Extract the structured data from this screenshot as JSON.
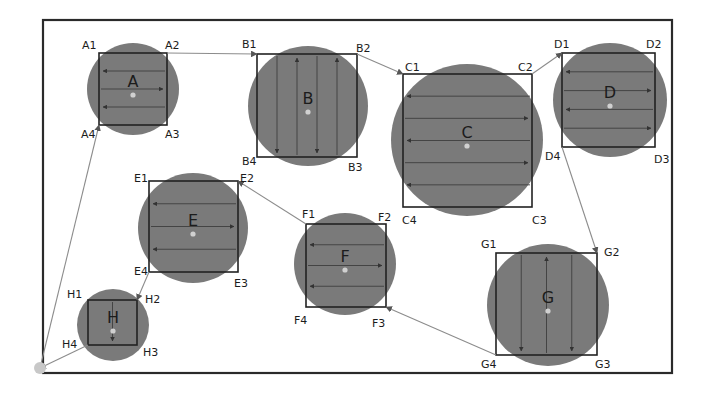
{
  "diagram": {
    "frame": {
      "x": 43,
      "y": 20,
      "w": 629,
      "h": 353
    },
    "colors": {
      "disk": "#7a7a7a",
      "square": "#222222",
      "link": "#8c8c8c",
      "frame": "#2a2a2a",
      "background": "#ffffff"
    },
    "start_point": {
      "x": 40,
      "y": 368
    },
    "areas": [
      {
        "id": "A",
        "label": "A",
        "cx": 133,
        "cy": 89,
        "r": 46,
        "sq": [
          99,
          53,
          167,
          125
        ],
        "scan": "horizontal",
        "lines": 3,
        "corners": [
          "A1",
          "A2",
          "A3",
          "A4"
        ]
      },
      {
        "id": "B",
        "label": "B",
        "cx": 308,
        "cy": 106,
        "r": 60,
        "sq": [
          257,
          54,
          357,
          157
        ],
        "scan": "vertical",
        "lines": 4,
        "corners": [
          "B1",
          "B2",
          "B3",
          "B4"
        ]
      },
      {
        "id": "C",
        "label": "C",
        "cx": 467,
        "cy": 140,
        "r": 76,
        "sq": [
          403,
          74,
          532,
          207
        ],
        "scan": "horizontal",
        "lines": 5,
        "corners": [
          "C1",
          "C2",
          "C3",
          "C4"
        ]
      },
      {
        "id": "D",
        "label": "D",
        "cx": 610,
        "cy": 100,
        "r": 57,
        "sq": [
          562,
          53,
          655,
          147
        ],
        "scan": "horizontal",
        "lines": 4,
        "corners": [
          "D1",
          "D2",
          "D3",
          "D4"
        ]
      },
      {
        "id": "E",
        "label": "E",
        "cx": 193,
        "cy": 228,
        "r": 55,
        "sq": [
          149,
          181,
          238,
          272
        ],
        "scan": "horizontal",
        "lines": 3,
        "corners": [
          "E1",
          "E2",
          "E3",
          "E4"
        ]
      },
      {
        "id": "F",
        "label": "F",
        "cx": 345,
        "cy": 264,
        "r": 51,
        "sq": [
          306,
          224,
          386,
          307
        ],
        "scan": "horizontal",
        "lines": 3,
        "corners": [
          "F1",
          "F2",
          "F3",
          "F4"
        ]
      },
      {
        "id": "G",
        "label": "G",
        "cx": 548,
        "cy": 305,
        "r": 61,
        "sq": [
          496,
          253,
          597,
          355
        ],
        "scan": "vertical",
        "lines": 3,
        "corners": [
          "G1",
          "G2",
          "G3",
          "G4"
        ]
      },
      {
        "id": "H",
        "label": "H",
        "cx": 113,
        "cy": 325,
        "r": 36,
        "sq": [
          88,
          300,
          137,
          345
        ],
        "scan": "vertical",
        "lines": 1,
        "corners": [
          "H1",
          "H2",
          "H3",
          "H4"
        ]
      }
    ],
    "corner_labels": {
      "A1": {
        "x": 82,
        "y": 49
      },
      "A2": {
        "x": 165,
        "y": 49
      },
      "A3": {
        "x": 165,
        "y": 138
      },
      "A4": {
        "x": 81,
        "y": 138
      },
      "B1": {
        "x": 242,
        "y": 48
      },
      "B2": {
        "x": 356,
        "y": 52
      },
      "B3": {
        "x": 348,
        "y": 171
      },
      "B4": {
        "x": 242,
        "y": 165
      },
      "C1": {
        "x": 405,
        "y": 71
      },
      "C2": {
        "x": 518,
        "y": 71
      },
      "C3": {
        "x": 532,
        "y": 224
      },
      "C4": {
        "x": 402,
        "y": 224
      },
      "D1": {
        "x": 554,
        "y": 48
      },
      "D2": {
        "x": 646,
        "y": 48
      },
      "D3": {
        "x": 654,
        "y": 163
      },
      "D4": {
        "x": 545,
        "y": 160
      },
      "E1": {
        "x": 134,
        "y": 182
      },
      "E2": {
        "x": 240,
        "y": 182
      },
      "E3": {
        "x": 234,
        "y": 287
      },
      "E4": {
        "x": 134,
        "y": 275
      },
      "F1": {
        "x": 302,
        "y": 218
      },
      "F2": {
        "x": 378,
        "y": 221
      },
      "F3": {
        "x": 372,
        "y": 327
      },
      "F4": {
        "x": 294,
        "y": 324
      },
      "G1": {
        "x": 481,
        "y": 248
      },
      "G2": {
        "x": 604,
        "y": 256
      },
      "G3": {
        "x": 595,
        "y": 368
      },
      "G4": {
        "x": 481,
        "y": 368
      },
      "H1": {
        "x": 67,
        "y": 298
      },
      "H2": {
        "x": 145,
        "y": 303
      },
      "H3": {
        "x": 143,
        "y": 356
      },
      "H4": {
        "x": 62,
        "y": 348
      }
    },
    "transitions": [
      {
        "from": "start",
        "to": "A4",
        "x1": 40,
        "y1": 368,
        "x2": 99,
        "y2": 125
      },
      {
        "from": "A2",
        "to": "B1",
        "x1": 167,
        "y1": 53,
        "x2": 257,
        "y2": 54
      },
      {
        "from": "B2",
        "to": "C1",
        "x1": 357,
        "y1": 54,
        "x2": 403,
        "y2": 74
      },
      {
        "from": "C2",
        "to": "D1",
        "x1": 532,
        "y1": 74,
        "x2": 562,
        "y2": 53
      },
      {
        "from": "D4",
        "to": "G2",
        "x1": 562,
        "y1": 147,
        "x2": 597,
        "y2": 253
      },
      {
        "from": "G4",
        "to": "F3",
        "x1": 496,
        "y1": 355,
        "x2": 386,
        "y2": 307
      },
      {
        "from": "F1",
        "to": "E2",
        "x1": 306,
        "y1": 224,
        "x2": 238,
        "y2": 181
      },
      {
        "from": "E4",
        "to": "H2",
        "x1": 149,
        "y1": 272,
        "x2": 137,
        "y2": 300
      },
      {
        "from": "H4",
        "to": "start",
        "x1": 88,
        "y1": 345,
        "x2": 40,
        "y2": 368
      }
    ]
  }
}
